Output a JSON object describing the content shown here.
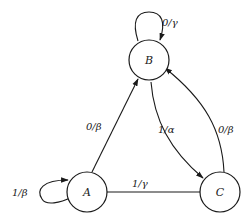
{
  "diagram": {
    "type": "finite-state-machine",
    "states": [
      {
        "id": "A",
        "label": "A"
      },
      {
        "id": "B",
        "label": "B"
      },
      {
        "id": "C",
        "label": "C"
      }
    ],
    "transitions": [
      {
        "from": "A",
        "to": "A",
        "label": "1/β"
      },
      {
        "from": "A",
        "to": "B",
        "label": "0/β"
      },
      {
        "from": "B",
        "to": "B",
        "label": "0/γ"
      },
      {
        "from": "B",
        "to": "C",
        "label": "1/α"
      },
      {
        "from": "C",
        "to": "B",
        "label": "0/β"
      },
      {
        "from": "C",
        "to": "A",
        "label": "1/γ"
      }
    ]
  }
}
